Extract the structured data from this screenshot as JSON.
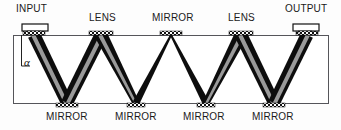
{
  "figure": {
    "type": "optical-multipass-slab-waveguide-diagram",
    "background_color": "#fdfdfd",
    "beam_color": "#0d0d0d",
    "beam_core_color": "#9a9a9a",
    "slab_outline_color": "#55555a",
    "coupler_fill_color": "#ffffff"
  },
  "top_labels": [
    {
      "name": "input",
      "text": "INPUT",
      "x": 16,
      "y": 4
    },
    {
      "name": "lens-left",
      "text": "LENS",
      "x": 89,
      "y": 13
    },
    {
      "name": "mirror-top",
      "text": "MIRROR",
      "x": 152,
      "y": 13
    },
    {
      "name": "lens-right",
      "text": "LENS",
      "x": 228,
      "y": 13
    },
    {
      "name": "output",
      "text": "OUTPUT",
      "x": 285,
      "y": 4
    }
  ],
  "bottom_labels": [
    {
      "name": "mirror-1",
      "text": "MIRROR",
      "x": 46,
      "y": 112
    },
    {
      "name": "mirror-2",
      "text": "MIRROR",
      "x": 115,
      "y": 112
    },
    {
      "name": "mirror-3",
      "text": "MIRROR",
      "x": 183,
      "y": 112
    },
    {
      "name": "mirror-4",
      "text": "MIRROR",
      "x": 252,
      "y": 112
    }
  ],
  "angle_annotation": {
    "name": "alpha",
    "symbol": "α",
    "x": 24,
    "y": 57
  },
  "slab": {
    "left": 13,
    "right": 328,
    "top": 35,
    "bottom": 103
  },
  "couplers": [
    {
      "name": "input-prism",
      "x": 22,
      "y": 24,
      "w": 26,
      "h": 7
    },
    {
      "name": "output-prism",
      "x": 293,
      "y": 24,
      "w": 26,
      "h": 7
    }
  ],
  "top_optics": [
    {
      "name": "input-grating",
      "cx": 34,
      "half": 11,
      "kind": "grating"
    },
    {
      "name": "lens-left",
      "cx": 101,
      "half": 12,
      "kind": "lens"
    },
    {
      "name": "mirror-top",
      "cx": 171,
      "half": 11,
      "kind": "mirror"
    },
    {
      "name": "lens-right",
      "cx": 241,
      "half": 12,
      "kind": "lens"
    },
    {
      "name": "output-grating",
      "cx": 307,
      "half": 11,
      "kind": "grating"
    }
  ],
  "bottom_optics": [
    {
      "name": "mirror-1",
      "cx": 67,
      "half": 11,
      "kind": "mirror"
    },
    {
      "name": "mirror-2",
      "cx": 136,
      "half": 9,
      "kind": "mirror"
    },
    {
      "name": "mirror-3",
      "cx": 206,
      "half": 9,
      "kind": "mirror"
    },
    {
      "name": "mirror-4",
      "cx": 274,
      "half": 11,
      "kind": "mirror"
    }
  ],
  "beam_segments": [
    {
      "name": "beam-seg-1",
      "x1": 34,
      "y1": 35,
      "x2": 67,
      "y2": 103,
      "w1": 13,
      "w2": 12,
      "core": true
    },
    {
      "name": "beam-seg-2",
      "x1": 67,
      "y1": 103,
      "x2": 101,
      "y2": 35,
      "w1": 12,
      "w2": 13,
      "core": true
    },
    {
      "name": "beam-seg-3",
      "x1": 101,
      "y1": 35,
      "x2": 136,
      "y2": 103,
      "w1": 13,
      "w2": 7,
      "core": true
    },
    {
      "name": "beam-seg-4",
      "x1": 136,
      "y1": 103,
      "x2": 171,
      "y2": 35,
      "w1": 7,
      "w2": 2,
      "core": false
    },
    {
      "name": "beam-seg-5",
      "x1": 171,
      "y1": 35,
      "x2": 206,
      "y2": 103,
      "w1": 2,
      "w2": 7,
      "core": false
    },
    {
      "name": "beam-seg-6",
      "x1": 206,
      "y1": 103,
      "x2": 241,
      "y2": 35,
      "w1": 7,
      "w2": 13,
      "core": true
    },
    {
      "name": "beam-seg-7",
      "x1": 241,
      "y1": 35,
      "x2": 274,
      "y2": 103,
      "w1": 13,
      "w2": 12,
      "core": true
    },
    {
      "name": "beam-seg-8",
      "x1": 274,
      "y1": 103,
      "x2": 307,
      "y2": 35,
      "w1": 12,
      "w2": 13,
      "core": true
    }
  ]
}
